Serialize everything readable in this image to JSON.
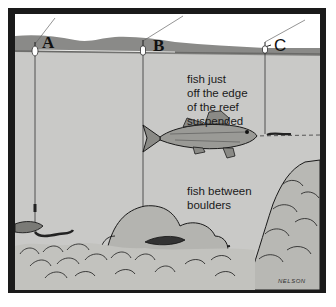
{
  "illustration": {
    "subject": "fishing positions around a reef",
    "markers": [
      {
        "id": "A",
        "label": "A"
      },
      {
        "id": "B",
        "label": "B"
      },
      {
        "id": "C",
        "label": "C"
      }
    ],
    "captions": {
      "suspended": [
        "fish just",
        "off the edge",
        "of the reef",
        "suspended"
      ],
      "boulders": [
        "fish between",
        "boulders"
      ]
    },
    "signature": "NELSON",
    "colors": {
      "frame": "#1a1a1a",
      "sky": "#ffffff",
      "shore": "#8a8a88",
      "water": "#c9c9c7",
      "ink": "#1a1a1a"
    }
  }
}
